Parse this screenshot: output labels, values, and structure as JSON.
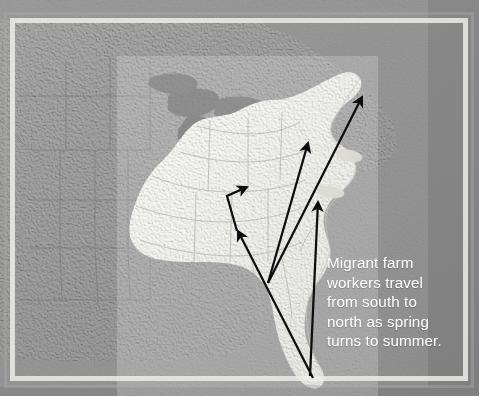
{
  "figure": {
    "kind": "photograph-of-relief-map",
    "region_depicted": "Eastern United States",
    "background_color": "#ffffff",
    "plate_color": "#8b8b8b",
    "frame_color": "#ecece8"
  },
  "map": {
    "ocean_color": "#868686",
    "land_color": "#e9e9e4",
    "inland_land_color": "#8f8f8f",
    "lake_color": "#6f6f6f",
    "border_line_color": "#6e6e6e",
    "highlighted_area_label": "Eastern United States",
    "labels": []
  },
  "annotation": {
    "caption_color": "#ffffff",
    "caption_text": "Migrant farm workers travel from south to north as spring turns to summer.",
    "caption_lines": [
      "Migrant farm",
      "workers travel",
      "from south to",
      "north as spring",
      "turns to summer."
    ]
  },
  "arrows": {
    "color": "#0d0d0d",
    "count": 4,
    "meaning": "migration direction south to north",
    "items": [
      {
        "name": "arrow-short-bent-midwest",
        "type": "bent",
        "points": "237,229 228,196 248,187",
        "head_at": "248,187"
      },
      {
        "name": "arrow-long-to-new-england",
        "type": "straight",
        "points": "268,283 363,96",
        "head_at": "363,96"
      },
      {
        "name": "arrow-long-to-northeast",
        "type": "straight",
        "points": "268,283 308,141",
        "head_at": "308,141"
      },
      {
        "name": "arrow-long-from-florida",
        "type": "straight",
        "points": "310,375 318,200",
        "head_at": "318,200"
      },
      {
        "name": "arrow-long-florida-to-midwest",
        "type": "straight",
        "points": "312,377 237,229",
        "head_at": "237,229"
      }
    ]
  }
}
